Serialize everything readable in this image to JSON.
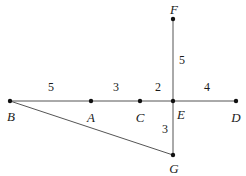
{
  "figure": {
    "type": "geometry-diagram",
    "width": 246,
    "height": 176,
    "background_color": "#ffffff",
    "stroke_color": "#555555",
    "text_color": "#1a1a1a"
  },
  "chart_data": {
    "type": "diagram",
    "title": "",
    "points": [
      {
        "id": "B",
        "label": "B",
        "x": 10,
        "y": 101,
        "label_x": 11,
        "label_y": 116
      },
      {
        "id": "A",
        "label": "A",
        "x": 91,
        "y": 101,
        "label_x": 91,
        "label_y": 117
      },
      {
        "id": "C",
        "label": "C",
        "x": 140,
        "y": 101,
        "label_x": 140,
        "label_y": 117
      },
      {
        "id": "E",
        "label": "E",
        "x": 173,
        "y": 101,
        "label_x": 181,
        "label_y": 114
      },
      {
        "id": "D",
        "label": "D",
        "x": 236,
        "y": 101,
        "label_x": 236,
        "label_y": 117
      },
      {
        "id": "F",
        "label": "F",
        "x": 173,
        "y": 19,
        "label_x": 174,
        "label_y": 9
      },
      {
        "id": "G",
        "label": "G",
        "x": 173,
        "y": 155,
        "label_x": 174,
        "label_y": 168
      }
    ],
    "segments": [
      {
        "id": "BD",
        "from": "B",
        "to": "D",
        "x1": 10,
        "y1": 101,
        "x2": 236,
        "y2": 101
      },
      {
        "id": "FG",
        "from": "F",
        "to": "G",
        "x1": 173,
        "y1": 19,
        "x2": 173,
        "y2": 155
      },
      {
        "id": "BG",
        "from": "B",
        "to": "G",
        "x1": 10,
        "y1": 101,
        "x2": 173,
        "y2": 155
      }
    ],
    "length_labels": [
      {
        "id": "BA",
        "value": "5",
        "segment": "B-A",
        "x": 51,
        "y": 87
      },
      {
        "id": "AC",
        "value": "3",
        "segment": "A-C",
        "x": 116,
        "y": 87
      },
      {
        "id": "CE",
        "value": "2",
        "segment": "C-E",
        "x": 158,
        "y": 87
      },
      {
        "id": "ED",
        "value": "4",
        "segment": "E-D",
        "x": 207,
        "y": 87
      },
      {
        "id": "EF",
        "value": "5",
        "segment": "E-F",
        "x": 182,
        "y": 60
      },
      {
        "id": "EG",
        "value": "3",
        "segment": "E-G",
        "x": 165,
        "y": 129
      }
    ]
  }
}
